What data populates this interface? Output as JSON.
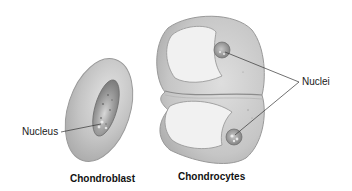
{
  "figure": {
    "cells": [
      {
        "id": "chondroblast",
        "caption": "Chondroblast",
        "callout": "Nucleus"
      },
      {
        "id": "chondrocytes",
        "caption": "Chondrocytes",
        "callout": "Nuclei"
      }
    ],
    "colors": {
      "matrix_fill": "#c9c9c9",
      "matrix_edge": "#9a9a9a",
      "lacuna_fill": "#f1f1f1",
      "nucleus_fill": "#8e8e8e",
      "leader_line": "#333333"
    }
  }
}
